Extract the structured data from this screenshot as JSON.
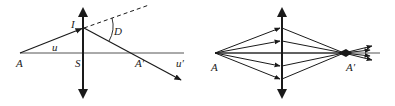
{
  "left_diagram": {
    "title": "Single ray refraction through thin lens",
    "labels": {
      "object_point": "A",
      "image_point": "A′",
      "lens_center": "S",
      "incidence_point": "I",
      "incident_angle": "u",
      "refracted_angle": "u′",
      "deviation": "D"
    }
  },
  "right_diagram": {
    "title": "Ray bundle focusing through converging lens",
    "labels": {
      "object_point": "A",
      "image_point": "A′"
    },
    "ray_heights": [
      28,
      41,
      53,
      66,
      79
    ]
  },
  "colors": {
    "line": "#1a1a1a",
    "axis": "#555555",
    "text": "#222222"
  }
}
